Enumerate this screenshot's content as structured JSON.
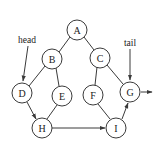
{
  "diagram": {
    "type": "binary-tree-with-leaf-linked-list",
    "nodes": [
      {
        "id": "A",
        "label": "A",
        "x": 77,
        "y": 30
      },
      {
        "id": "B",
        "label": "B",
        "x": 52,
        "y": 59
      },
      {
        "id": "C",
        "label": "C",
        "x": 100,
        "y": 58
      },
      {
        "id": "D",
        "label": "D",
        "x": 22,
        "y": 93
      },
      {
        "id": "E",
        "label": "E",
        "x": 62,
        "y": 96
      },
      {
        "id": "F",
        "label": "F",
        "x": 93,
        "y": 95
      },
      {
        "id": "G",
        "label": "G",
        "x": 130,
        "y": 92
      },
      {
        "id": "H",
        "label": "H",
        "x": 42,
        "y": 128
      },
      {
        "id": "I",
        "label": "I",
        "x": 116,
        "y": 128
      }
    ],
    "tree_edges": [
      {
        "from": "A",
        "to": "B"
      },
      {
        "from": "A",
        "to": "C"
      },
      {
        "from": "B",
        "to": "D"
      },
      {
        "from": "B",
        "to": "E"
      },
      {
        "from": "C",
        "to": "F"
      },
      {
        "from": "C",
        "to": "G"
      },
      {
        "from": "E",
        "to": "H"
      },
      {
        "from": "F",
        "to": "I"
      }
    ],
    "thread_edges": [
      {
        "from": "D",
        "to": "H",
        "directed": true
      },
      {
        "from": "H",
        "to": "I",
        "directed": true
      },
      {
        "from": "I",
        "to": "G",
        "directed": true
      }
    ],
    "pointers": {
      "head": {
        "label": "head",
        "target": "D"
      },
      "tail": {
        "label": "tail",
        "target": "G"
      }
    },
    "colors": {
      "stroke": "#3a3a3a",
      "text": "#222222",
      "background": "#ffffff"
    }
  }
}
